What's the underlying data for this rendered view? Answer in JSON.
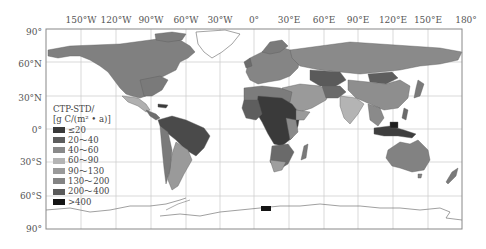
{
  "map": {
    "type": "choropleth",
    "projection": "equirectangular",
    "variable_label_line1": "CTP-STD/",
    "variable_label_line2": "[g C/(m² • a)]",
    "longitude_labels": [
      "150°W",
      "120°W",
      "90°W",
      "60°W",
      "30°W",
      "0°",
      "30°E",
      "60°E",
      "90°E",
      "120°E",
      "150°E",
      "180°"
    ],
    "latitude_labels": [
      "90°",
      "60°N",
      "30°N",
      "0°",
      "30°S",
      "60°S",
      "90°"
    ],
    "legend": {
      "title_line1": "CTP-STD/",
      "title_line2": "[g C/(m² • a)]",
      "position": "lower-left",
      "classes": [
        {
          "label": "≤20",
          "color": "#3a3a3a"
        },
        {
          "label": "20～40",
          "color": "#5e5e5e"
        },
        {
          "label": "40～60",
          "color": "#8a8a8a"
        },
        {
          "label": "60～90",
          "color": "#b4b4b4"
        },
        {
          "label": "90～130",
          "color": "#9a9a9a"
        },
        {
          "label": "130～200",
          "color": "#848484"
        },
        {
          "label": "200～400",
          "color": "#5a5a5a"
        },
        {
          "label": ">400",
          "color": "#141414"
        }
      ]
    },
    "colors": {
      "frame": "#888888",
      "grid": "#c8c8c8",
      "land_default": "#7f7f7f",
      "ocean": "#ffffff"
    }
  }
}
